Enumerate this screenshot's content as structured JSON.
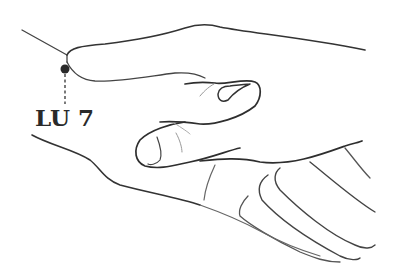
{
  "figure": {
    "acupoint": {
      "label": "LU 7",
      "marker_color": "#2a2a2a"
    },
    "colors": {
      "background": "#ffffff",
      "line_dark": "#2e2e2e",
      "line_light": "#8a8a8a"
    }
  }
}
